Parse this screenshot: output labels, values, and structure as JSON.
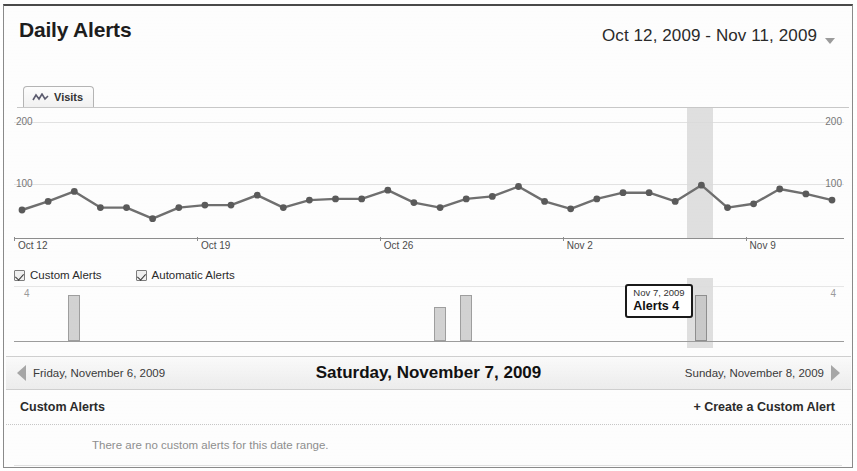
{
  "header": {
    "title": "Daily Alerts",
    "date_range": "Oct 12, 2009 - Nov 11, 2009",
    "caret_icon": "chevron-down-icon"
  },
  "tab": {
    "label": "Visits",
    "icon": "sparkline-icon"
  },
  "legend": {
    "items": [
      {
        "label": "Custom Alerts",
        "checked": true
      },
      {
        "label": "Automatic Alerts",
        "checked": true
      }
    ]
  },
  "tooltip": {
    "date": "Nov 7, 2009",
    "value": "Alerts 4"
  },
  "daynav": {
    "prev_label": "Friday, November 6, 2009",
    "current_label": "Saturday, November 7, 2009",
    "next_label": "Sunday, November 8, 2009",
    "prev_icon": "arrow-left-icon",
    "next_icon": "arrow-right-icon"
  },
  "section": {
    "title": "Custom Alerts",
    "create_link": "+ Create a Custom Alert",
    "empty_message": "There are no custom alerts for this date range."
  },
  "colors": {
    "line": "#6f6f6f",
    "marker": "#5a5a5a",
    "bar_fill": "#d2d2d2",
    "bar_border": "#9e9e9e",
    "highlight_band": "#d9d9d9",
    "gridline": "#e2e2e2",
    "text": "#2a2a2a"
  },
  "chart_data": [
    {
      "type": "line",
      "title": "Visits",
      "xlabel": "",
      "ylabel": "Visits",
      "ylim": [
        0,
        200
      ],
      "yticks": [
        100,
        200
      ],
      "left_axis_labels": [
        "200",
        "100"
      ],
      "right_axis_labels": [
        "200",
        "100"
      ],
      "grid": true,
      "legend": "none",
      "xtick_labels": [
        "Oct 12",
        "Oct 19",
        "Oct 26",
        "Nov 2",
        "Nov 9"
      ],
      "xtick_indices": [
        0,
        7,
        14,
        21,
        28
      ],
      "x": [
        "Oct 12",
        "Oct 13",
        "Oct 14",
        "Oct 15",
        "Oct 16",
        "Oct 17",
        "Oct 18",
        "Oct 19",
        "Oct 20",
        "Oct 21",
        "Oct 22",
        "Oct 23",
        "Oct 24",
        "Oct 25",
        "Oct 26",
        "Oct 27",
        "Oct 28",
        "Oct 29",
        "Oct 30",
        "Oct 31",
        "Nov 1",
        "Nov 2",
        "Nov 3",
        "Nov 4",
        "Nov 5",
        "Nov 6",
        "Nov 7",
        "Nov 8",
        "Nov 9",
        "Nov 10",
        "Nov 11"
      ],
      "values": [
        58,
        72,
        88,
        62,
        62,
        44,
        62,
        66,
        66,
        82,
        62,
        74,
        76,
        76,
        90,
        70,
        62,
        76,
        80,
        96,
        72,
        60,
        76,
        86,
        86,
        72,
        98,
        62,
        68,
        92,
        84,
        74
      ],
      "highlight_band": {
        "start_index": 25,
        "end_index": 26,
        "label": "Nov 7, 2009"
      }
    },
    {
      "type": "bar",
      "title": "Alerts",
      "ylim": [
        0,
        4
      ],
      "left_axis_labels": [
        "4"
      ],
      "right_axis_labels": [
        "4"
      ],
      "grid": true,
      "categories": [
        "Oct 12",
        "Oct 13",
        "Oct 14",
        "Oct 15",
        "Oct 16",
        "Oct 17",
        "Oct 18",
        "Oct 19",
        "Oct 20",
        "Oct 21",
        "Oct 22",
        "Oct 23",
        "Oct 24",
        "Oct 25",
        "Oct 26",
        "Oct 27",
        "Oct 28",
        "Oct 29",
        "Oct 30",
        "Oct 31",
        "Nov 1",
        "Nov 2",
        "Nov 3",
        "Nov 4",
        "Nov 5",
        "Nov 6",
        "Nov 7",
        "Nov 8",
        "Nov 9",
        "Nov 10",
        "Nov 11"
      ],
      "values": [
        0,
        0,
        4,
        0,
        0,
        0,
        0,
        0,
        0,
        0,
        0,
        0,
        0,
        0,
        0,
        0,
        3,
        4,
        0,
        0,
        0,
        0,
        0,
        0,
        0,
        0,
        4,
        0,
        0,
        0,
        0
      ],
      "selected_index": 26
    }
  ]
}
